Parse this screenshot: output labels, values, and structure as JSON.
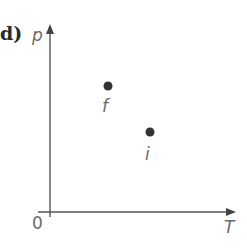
{
  "panel": {
    "label": "d)"
  },
  "axes": {
    "y_label": "p",
    "x_label": "T",
    "origin_label": "0"
  },
  "points": [
    {
      "name": "f",
      "label": "f",
      "x": 108,
      "y": 86
    },
    {
      "name": "i",
      "label": "i",
      "x": 150,
      "y": 132
    }
  ],
  "colors": {
    "axis": "#555555",
    "point": "#333333",
    "text": "#6a6a6a"
  }
}
